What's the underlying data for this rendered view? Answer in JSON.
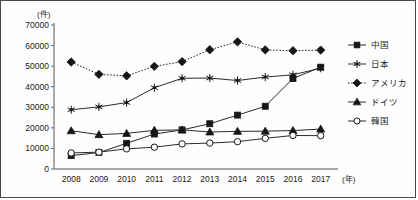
{
  "chart_data": {
    "type": "line",
    "title": "",
    "subtitle": "",
    "xlabel": "(年)",
    "ylabel": "(件)",
    "x": [
      2008,
      2009,
      2010,
      2011,
      2012,
      2013,
      2014,
      2015,
      2016,
      2017
    ],
    "xtick_labels": [
      "2008",
      "2009",
      "2010",
      "2011",
      "2012",
      "2013",
      "2014",
      "2015",
      "2016",
      "2017"
    ],
    "ytick_labels": [
      "0",
      "10000",
      "20000",
      "30000",
      "40000",
      "50000",
      "60000",
      "70000"
    ],
    "yticks": [
      0,
      10000,
      20000,
      30000,
      40000,
      50000,
      60000,
      70000
    ],
    "ylim": [
      0,
      70000
    ],
    "grid": false,
    "legend_position": "right",
    "series": [
      {
        "name": "中国",
        "marker": "filled-square",
        "linestyle": "solid",
        "color": "#161616",
        "values": [
          6500,
          8000,
          12500,
          17000,
          19000,
          22000,
          26200,
          30500,
          44000,
          49500
        ]
      },
      {
        "name": "日本",
        "marker": "star",
        "linestyle": "solid",
        "color": "#161616",
        "values": [
          28800,
          30200,
          32300,
          39500,
          44100,
          44200,
          43000,
          44700,
          45800,
          49000
        ]
      },
      {
        "name": "アメリカ",
        "marker": "filled-diamond",
        "linestyle": "dotted",
        "color": "#161616",
        "values": [
          52000,
          46000,
          45300,
          49900,
          52200,
          58000,
          61800,
          57900,
          57500,
          57800
        ]
      },
      {
        "name": "ドイツ",
        "marker": "filled-triangle",
        "linestyle": "solid",
        "color": "#161616",
        "values": [
          18600,
          16700,
          17300,
          18800,
          19000,
          18000,
          18300,
          18400,
          18700,
          19400
        ]
      },
      {
        "name": "韓国",
        "marker": "open-circle",
        "linestyle": "solid",
        "color": "#161616",
        "values": [
          7800,
          8200,
          9800,
          10600,
          12200,
          12600,
          13300,
          14900,
          16300,
          16200
        ]
      }
    ]
  },
  "axes": {
    "y_unit_label": "(件)",
    "x_unit_label": "(年)"
  },
  "legend": {
    "items": [
      {
        "label": "中国",
        "marker": "filled-square",
        "linestyle": "solid"
      },
      {
        "label": "日本",
        "marker": "star",
        "linestyle": "solid"
      },
      {
        "label": "アメリカ",
        "marker": "filled-diamond",
        "linestyle": "dotted"
      },
      {
        "label": "ドイツ",
        "marker": "filled-triangle",
        "linestyle": "solid"
      },
      {
        "label": "韓国",
        "marker": "open-circle",
        "linestyle": "solid"
      }
    ]
  }
}
